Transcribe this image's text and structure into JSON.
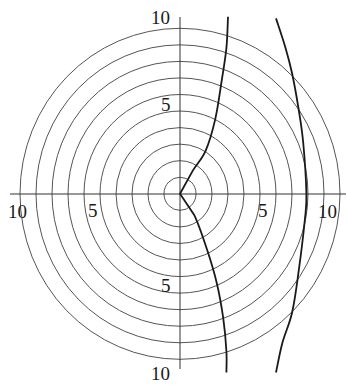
{
  "chart_data": {
    "type": "line",
    "subtype": "polar-grid-with-curves",
    "title": "",
    "xlabel": "",
    "ylabel": "",
    "grid": true,
    "grid_rings": [
      1,
      2,
      3,
      4,
      5,
      6,
      7,
      8,
      9,
      10
    ],
    "axis_range": {
      "r": [
        0,
        10
      ]
    },
    "tick_labels": {
      "top": [
        "5",
        "10"
      ],
      "bottom": [
        "5",
        "10"
      ],
      "left": [
        "5",
        "10"
      ],
      "right": [
        "5",
        "10"
      ]
    },
    "series": [
      {
        "name": "inner-curve",
        "description": "curve from origin cusp, bending right then nearly vertical, x≈3 at |y|=10",
        "points": [
          [
            3.0,
            10.7
          ],
          [
            2.9,
            8.8
          ],
          [
            2.6,
            6.8
          ],
          [
            2.2,
            4.5
          ],
          [
            1.6,
            2.6
          ],
          [
            0.8,
            1.4
          ],
          [
            0,
            0
          ],
          [
            0.9,
            -1.3
          ],
          [
            1.7,
            -3.4
          ],
          [
            2.3,
            -5.4
          ],
          [
            2.7,
            -7.5
          ],
          [
            2.9,
            -9.5
          ],
          [
            2.9,
            -10.8
          ]
        ]
      },
      {
        "name": "outer-curve",
        "description": "arc crossing x-axis at about 8, x≈6 at |y|=10",
        "points": [
          [
            6.0,
            10.6
          ],
          [
            6.6,
            8.8
          ],
          [
            7.0,
            7.3
          ],
          [
            7.4,
            5.2
          ],
          [
            7.7,
            3.1
          ],
          [
            7.9,
            0.0
          ],
          [
            7.8,
            -1.6
          ],
          [
            7.4,
            -4.8
          ],
          [
            7.0,
            -7.2
          ],
          [
            6.4,
            -9.0
          ],
          [
            6.0,
            -10.8
          ]
        ]
      }
    ]
  }
}
